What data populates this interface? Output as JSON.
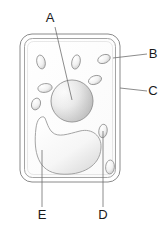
{
  "figure": {
    "background_color": "#ffffff",
    "outline_color": "#7a7a7a",
    "label_color": "#1a1a1a"
  },
  "labels": [
    {
      "id": "A",
      "text": "A",
      "x": 53,
      "y": 20,
      "target_x": 72,
      "target_y": 98,
      "points_to": "nucleus"
    },
    {
      "id": "B",
      "text": "B",
      "x": 152,
      "y": 58,
      "target_x": 113,
      "target_y": 56,
      "points_to": "cell-membrane"
    },
    {
      "id": "C",
      "text": "C",
      "x": 152,
      "y": 95,
      "target_x": 120,
      "target_y": 88,
      "points_to": "cell-wall"
    },
    {
      "id": "D",
      "text": "D",
      "x": 101,
      "y": 215,
      "target_x": 103,
      "target_y": 131,
      "points_to": "chloroplast"
    },
    {
      "id": "E",
      "text": "E",
      "x": 40,
      "y": 215,
      "target_x": 42,
      "target_y": 150,
      "points_to": "vacuole"
    }
  ],
  "structures": {
    "cell_wall": {
      "name": "cell wall",
      "x": 20,
      "y": 34,
      "width": 100,
      "height": 148,
      "radius": 12
    },
    "cell_membrane": {
      "name": "cell membrane",
      "x": 24,
      "y": 38,
      "width": 92,
      "height": 140,
      "radius": 9
    },
    "nucleus": {
      "name": "nucleus",
      "cx": 72,
      "cy": 101,
      "rx": 21,
      "ry": 21
    },
    "vacuole": {
      "name": "vacuole",
      "cx": 62,
      "cy": 145
    },
    "organelles": [
      {
        "name": "organelle",
        "cx": 41,
        "cy": 62,
        "rx": 4.2,
        "ry": 7.0,
        "rot": -12
      },
      {
        "name": "organelle",
        "cx": 76,
        "cy": 62,
        "rx": 4.2,
        "ry": 7.2,
        "rot": 12
      },
      {
        "name": "organelle",
        "cx": 104,
        "cy": 59,
        "rx": 6.5,
        "ry": 4.2,
        "rot": -22
      },
      {
        "name": "organelle",
        "cx": 95,
        "cy": 80,
        "rx": 6.8,
        "ry": 4.2,
        "rot": -20
      },
      {
        "name": "organelle",
        "cx": 45,
        "cy": 88,
        "rx": 7.2,
        "ry": 4.4,
        "rot": -8
      },
      {
        "name": "organelle",
        "cx": 36,
        "cy": 104,
        "rx": 4.4,
        "ry": 6.0,
        "rot": 18
      },
      {
        "name": "organelle",
        "cx": 103,
        "cy": 131,
        "rx": 4.2,
        "ry": 6.8,
        "rot": 8
      },
      {
        "name": "organelle",
        "cx": 110,
        "cy": 167,
        "rx": 4.4,
        "ry": 7.0,
        "rot": 4
      }
    ]
  }
}
